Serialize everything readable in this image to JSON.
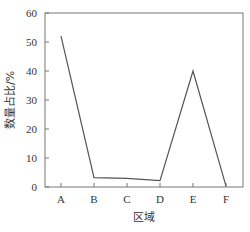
{
  "chart_data": {
    "type": "line",
    "title": "",
    "xlabel": "区域",
    "ylabel": "数量占比/%",
    "categories": [
      "A",
      "B",
      "C",
      "D",
      "E",
      "F"
    ],
    "series": [
      {
        "name": "数量占比",
        "values": [
          52,
          3.2,
          3.0,
          2.2,
          40,
          0.3
        ]
      }
    ],
    "ylim": [
      0,
      60
    ],
    "yticks": [
      0,
      10,
      20,
      30,
      40,
      50,
      60
    ],
    "grid": false,
    "legend": "none",
    "colors": {
      "line": "#555555",
      "axis": "#666666"
    }
  }
}
